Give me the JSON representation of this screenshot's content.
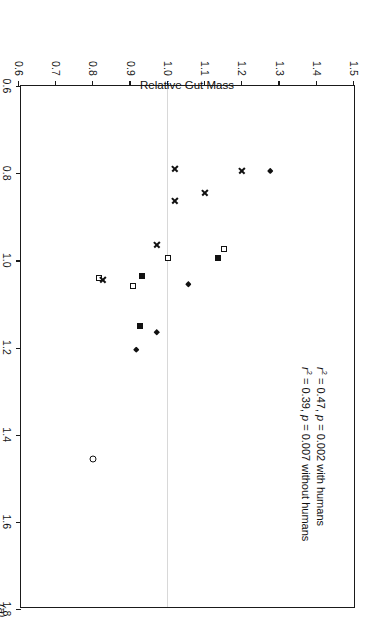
{
  "figure": {
    "panel_label": "(a)",
    "rotation_degrees": 90
  },
  "chart_data": {
    "type": "scatter",
    "title": "",
    "xlabel": "Relative Brain Mass",
    "ylabel": "Relative Gut Mass",
    "xlim": [
      0.6,
      1.8
    ],
    "ylim": [
      0.6,
      1.5
    ],
    "xticks": [
      "0.6",
      "0.8",
      "1.0",
      "1.2",
      "1.4",
      "1.6",
      "1.8"
    ],
    "yticks": [
      "0.6",
      "0.7",
      "0.8",
      "0.9",
      "1.0",
      "1.1",
      "1.2",
      "1.3",
      "1.4",
      "1.5"
    ],
    "xtick_values": [
      0.6,
      0.8,
      1.0,
      1.2,
      1.4,
      1.6,
      1.8
    ],
    "ytick_values": [
      0.6,
      0.7,
      0.8,
      0.9,
      1.0,
      1.1,
      1.2,
      1.3,
      1.4,
      1.5
    ],
    "grid": "single horizontal reference line at y = 1.0",
    "gridlines_y": [
      1.0
    ],
    "legend": "none",
    "legend_position": "none",
    "annotations": [
      "r² = 0.47, p = 0.002 with humans",
      "r² = 0.39, p = 0.007 without humans"
    ],
    "annotation_parts": [
      {
        "r2_label": "r",
        "r2_sup": "2",
        "r2_eq": " = 0.47, ",
        "p_label": "p",
        "p_eq": " = 0.002 with humans"
      },
      {
        "r2_label": "r",
        "r2_sup": "2",
        "r2_eq": " = 0.39, ",
        "p_label": "p",
        "p_eq": " = 0.007 without humans"
      }
    ],
    "series": [
      {
        "name": "filled-diamond",
        "marker": "filled-diamond",
        "points": [
          {
            "x": 0.795,
            "y": 1.275
          },
          {
            "x": 1.055,
            "y": 1.055
          },
          {
            "x": 1.165,
            "y": 0.97
          },
          {
            "x": 1.205,
            "y": 0.915
          }
        ]
      },
      {
        "name": "filled-square",
        "marker": "filled-square",
        "points": [
          {
            "x": 0.995,
            "y": 1.135
          },
          {
            "x": 1.035,
            "y": 0.93
          },
          {
            "x": 1.15,
            "y": 0.925
          }
        ]
      },
      {
        "name": "open-square",
        "marker": "open-square",
        "points": [
          {
            "x": 0.975,
            "y": 1.15
          },
          {
            "x": 0.995,
            "y": 1.0
          },
          {
            "x": 1.06,
            "y": 0.905
          },
          {
            "x": 1.04,
            "y": 0.815
          }
        ]
      },
      {
        "name": "cross",
        "marker": "cross",
        "points": [
          {
            "x": 0.795,
            "y": 1.2
          },
          {
            "x": 0.79,
            "y": 1.02
          },
          {
            "x": 0.845,
            "y": 1.1
          },
          {
            "x": 0.865,
            "y": 1.02
          },
          {
            "x": 0.965,
            "y": 0.97
          },
          {
            "x": 1.045,
            "y": 0.825
          }
        ]
      },
      {
        "name": "open-circle",
        "marker": "open-circle",
        "points": [
          {
            "x": 1.455,
            "y": 0.8
          }
        ]
      }
    ]
  }
}
